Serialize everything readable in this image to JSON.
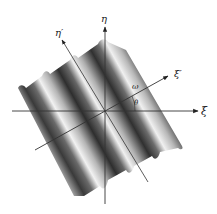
{
  "figure": {
    "axes": {
      "xi": {
        "label": "ξ",
        "direction": "horizontal"
      },
      "eta": {
        "label": "η",
        "direction": "vertical"
      },
      "xi_prime": {
        "label": "ξ′",
        "direction": "rotated by θ"
      },
      "eta_prime": {
        "label": "η′",
        "direction": "rotated by θ"
      }
    },
    "annotations": {
      "frequency": "ω",
      "angle": "θ"
    },
    "colors": {
      "axis": "#333333",
      "surface_dark": "#2a2a2a",
      "surface_light": "#f4f4f4",
      "background": "#ffffff"
    }
  }
}
